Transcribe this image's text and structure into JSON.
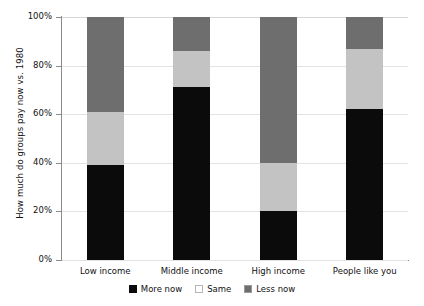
{
  "chart_data": {
    "type": "bar",
    "subtype": "stacked-bar-100-percent",
    "title": "",
    "xlabel": "",
    "ylabel": "How much do groups pay now vs. 1980",
    "ylim": [
      0,
      100
    ],
    "ytick_labels": [
      "0%",
      "20%",
      "40%",
      "60%",
      "80%",
      "100%"
    ],
    "ytick_values": [
      0,
      20,
      40,
      60,
      80,
      100
    ],
    "grid": true,
    "legend_position": "bottom-center",
    "categories": [
      "Low income",
      "Middle income",
      "High income",
      "People like you"
    ],
    "series": [
      {
        "name": "More now",
        "color": "#0b0b0b",
        "values": [
          39,
          71,
          20,
          62
        ]
      },
      {
        "name": "Same",
        "color": "#c3c3c3",
        "values": [
          22,
          15,
          20,
          25
        ]
      },
      {
        "name": "Less now",
        "color": "#6e6e6e",
        "values": [
          39,
          14,
          60,
          13
        ]
      }
    ]
  },
  "axis": {
    "y_title": "How much do groups pay now vs. 1980"
  }
}
